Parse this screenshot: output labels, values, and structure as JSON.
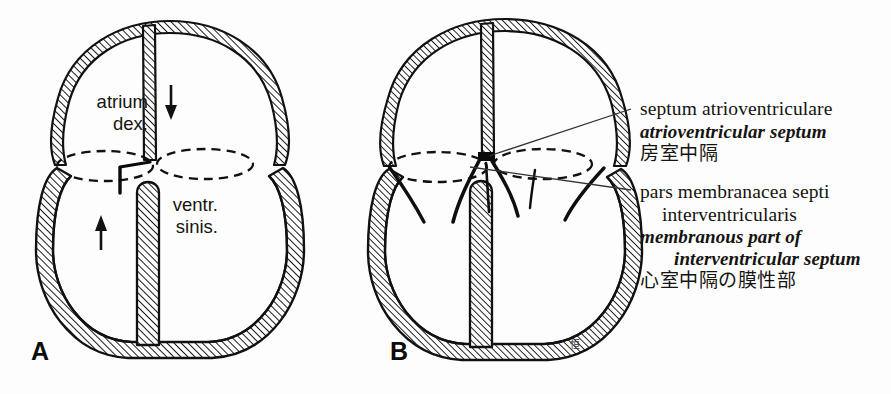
{
  "figure": {
    "background_color": "#fdfdfd",
    "ink_color": "#111111",
    "hatch_color": "#1a1a1a"
  },
  "panels": [
    {
      "id": "A",
      "letter": "A",
      "annotations": {
        "atrium_label_line1": "atrium",
        "atrium_label_line2": "dex.",
        "ventricle_label_line1": "ventr.",
        "ventricle_label_line2": "sinis.",
        "arrow_down": "↓",
        "arrow_up": "↑"
      }
    },
    {
      "id": "B",
      "letter": "B",
      "signature": "恒"
    }
  ],
  "callouts": [
    {
      "id": "septum-atrioventriculare",
      "latin": "septum atrioventriculare",
      "english": "atrioventricular septum",
      "japanese": "房室中隔",
      "leader_from_x": 631,
      "leader_from_y": 108,
      "leader_to_x": 489,
      "leader_to_y": 155
    },
    {
      "id": "pars-membranacea-septi-interventricularis",
      "latin_line1": "pars membranacea septi",
      "latin_line2": "interventricularis",
      "english_line1": "membranous part of",
      "english_line2": "interventricular septum",
      "japanese": "心室中隔の膜性部",
      "leader_from_x": 631,
      "leader_from_y": 190,
      "leader_to_x": 470,
      "leader_to_y": 166
    }
  ]
}
